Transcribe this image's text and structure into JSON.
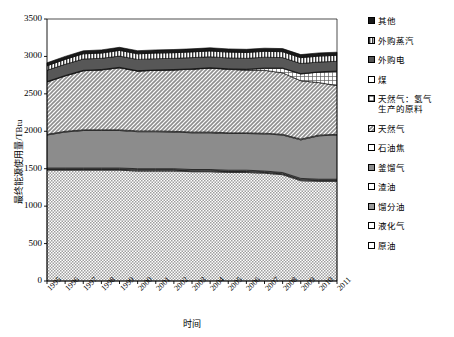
{
  "chart_data": {
    "type": "area",
    "stacked": true,
    "title": "",
    "xlabel": "时间",
    "ylabel": "最终能源使用量/TBtu",
    "ylim": [
      0,
      3500
    ],
    "yticks": [
      0,
      500,
      1000,
      1500,
      2000,
      2500,
      3000,
      3500
    ],
    "grid": false,
    "legend_position": "right",
    "categories": [
      "1995",
      "1996",
      "1997",
      "1998",
      "1999",
      "2000",
      "2001",
      "2002",
      "2003",
      "2004",
      "2005",
      "2006",
      "2007",
      "2008",
      "2009",
      "2010",
      "2011"
    ],
    "series": [
      {
        "name": "原油",
        "pattern": "fine-dots-light",
        "color": "#c8c8c8",
        "values": [
          1480,
          1480,
          1480,
          1480,
          1480,
          1470,
          1470,
          1470,
          1460,
          1460,
          1450,
          1450,
          1440,
          1420,
          1340,
          1330,
          1330
        ]
      },
      {
        "name": "液化气",
        "pattern": "blank",
        "color": "#ffffff",
        "values": [
          10,
          10,
          10,
          10,
          10,
          10,
          10,
          10,
          10,
          10,
          10,
          10,
          10,
          10,
          10,
          10,
          10
        ]
      },
      {
        "name": "馏分油",
        "pattern": "solid-mid",
        "color": "#9a9a9a",
        "values": [
          10,
          10,
          10,
          10,
          10,
          10,
          10,
          10,
          10,
          10,
          10,
          10,
          10,
          10,
          10,
          10,
          10
        ]
      },
      {
        "name": "渣油",
        "pattern": "blank",
        "color": "#ffffff",
        "values": [
          10,
          10,
          10,
          10,
          10,
          10,
          10,
          10,
          10,
          10,
          10,
          10,
          10,
          10,
          10,
          10,
          10
        ]
      },
      {
        "name": "釜馏气",
        "pattern": "solid-dark",
        "color": "#8c8c8c",
        "values": [
          440,
          480,
          500,
          500,
          500,
          495,
          495,
          490,
          490,
          490,
          490,
          490,
          495,
          500,
          515,
          580,
          590
        ]
      },
      {
        "name": "石油焦",
        "pattern": "blank",
        "color": "#ffffff",
        "values": [
          10,
          10,
          10,
          10,
          10,
          10,
          10,
          10,
          10,
          10,
          10,
          10,
          10,
          10,
          10,
          10,
          10
        ]
      },
      {
        "name": "天然气",
        "pattern": "diag-hatch",
        "color": "#b6b6b6",
        "values": [
          700,
          740,
          790,
          800,
          830,
          800,
          810,
          820,
          840,
          855,
          850,
          835,
          840,
          820,
          780,
          700,
          650
        ]
      },
      {
        "name": "天然气：氢气生产的原料",
        "pattern": "cross-hatch",
        "color": "#a0a0a0",
        "values": [
          0,
          0,
          0,
          0,
          0,
          0,
          0,
          0,
          0,
          0,
          0,
          10,
          25,
          60,
          90,
          140,
          190
        ]
      },
      {
        "name": "煤",
        "pattern": "blank",
        "color": "#ffffff",
        "values": [
          5,
          5,
          5,
          5,
          5,
          5,
          5,
          5,
          5,
          5,
          5,
          5,
          5,
          5,
          5,
          5,
          5
        ]
      },
      {
        "name": "外购电",
        "pattern": "solid-darkgray",
        "color": "#575757",
        "values": [
          150,
          150,
          150,
          150,
          150,
          150,
          150,
          150,
          150,
          145,
          145,
          145,
          145,
          140,
          135,
          130,
          130
        ]
      },
      {
        "name": "外购蒸汽",
        "pattern": "vertical-stripes",
        "color": "#d0d0d0",
        "values": [
          60,
          65,
          70,
          70,
          75,
          75,
          75,
          75,
          75,
          78,
          78,
          78,
          78,
          78,
          78,
          80,
          80
        ]
      },
      {
        "name": "其他",
        "pattern": "solid-black",
        "color": "#1a1a1a",
        "values": [
          40,
          40,
          40,
          42,
          42,
          42,
          42,
          42,
          42,
          42,
          42,
          42,
          42,
          42,
          42,
          42,
          42
        ]
      }
    ]
  },
  "legend": {
    "items": [
      {
        "label": "其他",
        "pattern": "solid-black"
      },
      {
        "label": "外购蒸汽",
        "pattern": "vertical-stripes"
      },
      {
        "label": "外购电",
        "pattern": "solid-darkgray"
      },
      {
        "label": "煤",
        "pattern": "blank"
      },
      {
        "label": "天然气：氢气\n生产的原料",
        "pattern": "cross-hatch"
      },
      {
        "label": "天然气",
        "pattern": "diag-hatch"
      },
      {
        "label": "石油焦",
        "pattern": "blank"
      },
      {
        "label": "釜馏气",
        "pattern": "solid-dark"
      },
      {
        "label": "渣油",
        "pattern": "blank"
      },
      {
        "label": "馏分油",
        "pattern": "solid-mid"
      },
      {
        "label": "液化气",
        "pattern": "blank"
      },
      {
        "label": "原油",
        "pattern": "blank"
      }
    ]
  }
}
